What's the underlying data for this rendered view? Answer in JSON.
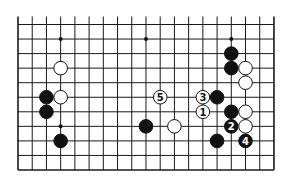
{
  "diagram": {
    "board": {
      "columns_visible": 19,
      "rows_visible": 11,
      "edges": [
        "left",
        "right",
        "bottom"
      ],
      "open_edge": "top"
    },
    "colors": {
      "line": "#1a1a1a",
      "black_stone": "#111111",
      "white_stone": "#ffffff",
      "background": "#ffffff"
    },
    "star_points": [
      {
        "col": 3,
        "row": 1
      },
      {
        "col": 9,
        "row": 1
      },
      {
        "col": 15,
        "row": 1
      },
      {
        "col": 3,
        "row": 7
      }
    ],
    "stones": [
      {
        "color": "white",
        "col": 3,
        "row": 3,
        "label": ""
      },
      {
        "color": "black",
        "col": 2,
        "row": 5,
        "label": ""
      },
      {
        "color": "white",
        "col": 3,
        "row": 5,
        "label": ""
      },
      {
        "color": "black",
        "col": 2,
        "row": 6,
        "label": ""
      },
      {
        "color": "black",
        "col": 3,
        "row": 8,
        "label": ""
      },
      {
        "color": "white",
        "col": 10,
        "row": 5,
        "label": "5"
      },
      {
        "color": "black",
        "col": 9,
        "row": 7,
        "label": ""
      },
      {
        "color": "white",
        "col": 11,
        "row": 7,
        "label": ""
      },
      {
        "color": "white",
        "col": 13,
        "row": 5,
        "label": "3"
      },
      {
        "color": "white",
        "col": 13,
        "row": 6,
        "label": "1"
      },
      {
        "color": "black",
        "col": 14,
        "row": 5,
        "label": ""
      },
      {
        "color": "black",
        "col": 15,
        "row": 2,
        "label": ""
      },
      {
        "color": "black",
        "col": 15,
        "row": 3,
        "label": ""
      },
      {
        "color": "white",
        "col": 16,
        "row": 3,
        "label": ""
      },
      {
        "color": "white",
        "col": 16,
        "row": 4,
        "label": ""
      },
      {
        "color": "black",
        "col": 15,
        "row": 6,
        "label": ""
      },
      {
        "color": "white",
        "col": 16,
        "row": 6,
        "label": ""
      },
      {
        "color": "black",
        "col": 15,
        "row": 7,
        "label": "2"
      },
      {
        "color": "white",
        "col": 16,
        "row": 7,
        "label": ""
      },
      {
        "color": "black",
        "col": 14,
        "row": 8,
        "label": ""
      },
      {
        "color": "black",
        "col": 16,
        "row": 8,
        "label": "4"
      }
    ]
  }
}
